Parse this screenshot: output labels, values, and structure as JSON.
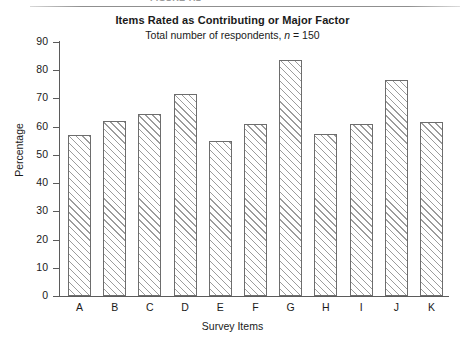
{
  "top_strip": {
    "cut_off_caption": "FIGURE 7.1"
  },
  "chart_data": {
    "type": "bar",
    "title": "Items Rated as Contributing or Major Factor",
    "subtitle_prefix": "Total number of respondents, ",
    "subtitle_italic": "n",
    "subtitle_suffix": " = 150",
    "subtitle": "Total number of respondents, n = 150",
    "xlabel": "Survey Items",
    "ylabel": "Percentage",
    "categories": [
      "A",
      "B",
      "C",
      "D",
      "E",
      "F",
      "G",
      "H",
      "I",
      "J",
      "K"
    ],
    "values": [
      57,
      62,
      64.5,
      71.5,
      55,
      61,
      83.5,
      57.5,
      61,
      76.5,
      61.5
    ],
    "ylim": [
      0,
      90
    ],
    "ytick_values": [
      0,
      10,
      20,
      30,
      40,
      50,
      60,
      70,
      80,
      90
    ],
    "ytick_labels": [
      "0",
      "10",
      "20",
      "30",
      "40",
      "50",
      "60",
      "70",
      "80",
      "90"
    ],
    "grid": false,
    "legend": null,
    "bar_fill": "hatched-diagonal",
    "bar_edge_color": "#6d6d6d",
    "hatch_color": "#9c9c9c",
    "background": "#ffffff"
  }
}
